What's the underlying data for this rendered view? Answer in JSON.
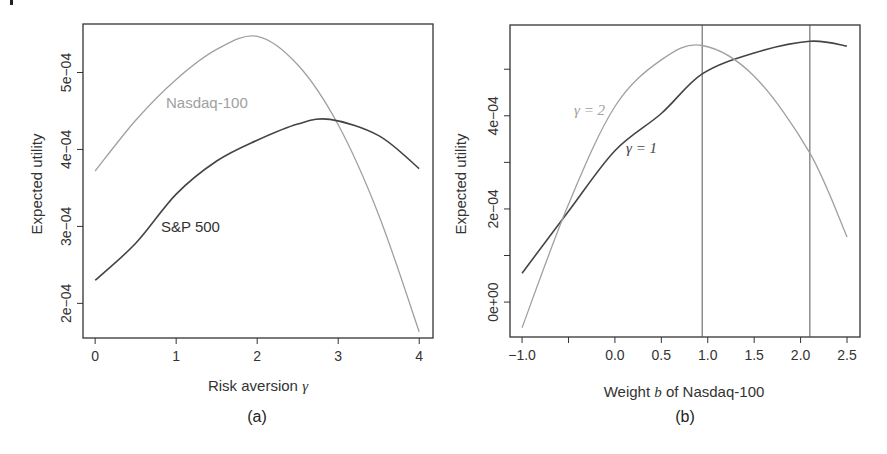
{
  "colors": {
    "dark": "#444444",
    "light": "#a0a0a0",
    "frame": "#333333"
  },
  "chart_data": [
    {
      "panel": "(a)",
      "type": "line",
      "title": "",
      "xlabel": "Risk aversion γ",
      "xlabel_prefix": "Risk aversion ",
      "xlabel_symbol": "γ",
      "ylabel": "Expected utility",
      "xlim": [
        -0.15,
        4.17
      ],
      "ylim": [
        0.000155,
        0.000563
      ],
      "xticks": [
        0,
        1,
        2,
        3,
        4
      ],
      "xtick_labels": [
        "0",
        "1",
        "2",
        "3",
        "4"
      ],
      "yticks": [
        0.0002,
        0.0003,
        0.0004,
        0.0005
      ],
      "ytick_labels": [
        "2e−04",
        "3e−04",
        "4e−04",
        "5e−04"
      ],
      "grid": false,
      "series": [
        {
          "name": "Nasdaq-100",
          "color": "#a0a0a0",
          "x": [
            0,
            0.5,
            1,
            1.5,
            2,
            2.5,
            3,
            3.5,
            4
          ],
          "y": [
            0.000372,
            0.000438,
            0.000491,
            0.00053,
            0.000547,
            0.00051,
            0.000432,
            0.000315,
            0.000163
          ]
        },
        {
          "name": "S&P 500",
          "color": "#444444",
          "x": [
            0,
            0.5,
            1,
            1.5,
            2,
            2.5,
            2.9,
            3.5,
            4
          ],
          "y": [
            0.00023,
            0.000278,
            0.000342,
            0.000385,
            0.000412,
            0.000433,
            0.000439,
            0.000418,
            0.000375
          ]
        }
      ],
      "annotations": [
        {
          "text": "Nasdaq-100",
          "x": 1.45,
          "y": 0.000465
        },
        {
          "text": "S&P 500",
          "x": 1.25,
          "y": 0.000295
        }
      ]
    },
    {
      "panel": "(b)",
      "type": "line",
      "title": "",
      "xlabel": "Weight b of Nasdaq-100",
      "xlabel_prefix": "Weight ",
      "xlabel_symbol": "b",
      "xlabel_suffix": " of Nasdaq-100",
      "ylabel": "Expected utility",
      "xlim": [
        -1.13,
        2.64
      ],
      "ylim": [
        -7.5e-05,
        0.000595
      ],
      "xticks": [
        -1.0,
        -0.5,
        0.0,
        0.5,
        1.0,
        1.5,
        2.0,
        2.5
      ],
      "xtick_labels": [
        "−1.0",
        "",
        "0.0",
        "0.5",
        "1.0",
        "1.5",
        "2.0",
        "2.5"
      ],
      "yticks": [
        0,
        0.0001,
        0.0002,
        0.0003,
        0.0004,
        0.0005
      ],
      "ytick_labels": [
        "0e+00",
        "",
        "2e−04",
        "",
        "4e−04",
        ""
      ],
      "grid": false,
      "vlines": [
        0.94,
        2.1
      ],
      "series": [
        {
          "name": "γ=1",
          "color": "#444444",
          "x": [
            -1.0,
            -0.5,
            0.0,
            0.5,
            0.94,
            1.5,
            2.1,
            2.5
          ],
          "y": [
            6.2e-05,
            0.000195,
            0.000325,
            0.000405,
            0.00049,
            0.000535,
            0.00056,
            0.00055
          ]
        },
        {
          "name": "γ=2",
          "color": "#a0a0a0",
          "x": [
            -1.0,
            -0.5,
            0.0,
            0.5,
            0.94,
            1.5,
            2.1,
            2.5
          ],
          "y": [
            -5.5e-05,
            0.00021,
            0.00042,
            0.00052,
            0.000551,
            0.000485,
            0.00032,
            0.00014
          ]
        }
      ],
      "annotations": [
        {
          "text": "γ=2",
          "x": -0.3,
          "y": 0.00041
        },
        {
          "text": "γ=1",
          "x": 0.2,
          "y": 0.000335
        }
      ]
    }
  ],
  "panels": {
    "a": {
      "caption": "(a)",
      "ylabel": "Expected utility",
      "xlabel_prefix": "Risk aversion ",
      "xlabel_symbol": "γ",
      "label_nasdaq": "Nasdaq-100",
      "label_sp": "S&P 500"
    },
    "b": {
      "caption": "(b)",
      "ylabel": "Expected utility",
      "xlabel_prefix": "Weight ",
      "xlabel_symbol": "b",
      "xlabel_suffix": " of Nasdaq-100",
      "label_g2": "γ = 2",
      "label_g1": "γ = 1"
    }
  }
}
